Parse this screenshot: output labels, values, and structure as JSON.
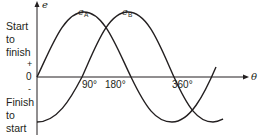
{
  "diagram": {
    "y_axis_label": "e",
    "x_axis_label": "θ",
    "origin_label": "0",
    "plus_label": "+",
    "minus_label": "-",
    "top_side_label": [
      "Start",
      "to",
      "finish"
    ],
    "bottom_side_label": [
      "Finish",
      "to",
      "start"
    ],
    "tick_labels": [
      "90°",
      "180°",
      "360°"
    ],
    "curves": [
      {
        "name": "e",
        "subscript": "A",
        "phase": "sine starting at 0"
      },
      {
        "name": "e",
        "subscript": "B",
        "phase": "lags e_A by 90°, starts at negative peak"
      }
    ],
    "line_color": "#231f20"
  }
}
